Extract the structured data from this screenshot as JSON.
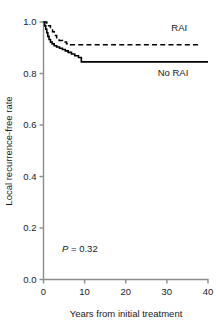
{
  "chart_data": {
    "type": "line",
    "title": "",
    "subtitle": "",
    "xlabel": "Years from initial treatment",
    "ylabel": "Local recurrence-free rate",
    "xlim": [
      0,
      40
    ],
    "ylim": [
      0.0,
      1.0
    ],
    "xticks": [
      0,
      10,
      20,
      30,
      40
    ],
    "xtick_labels": [
      "0",
      "10",
      "20",
      "30",
      "40"
    ],
    "yticks": [
      0.0,
      0.2,
      0.4,
      0.6,
      0.8,
      1.0
    ],
    "ytick_labels": [
      "0.0",
      "0.2",
      "0.4",
      "0.6",
      "0.8",
      "1.0"
    ],
    "grid": false,
    "legend_position": "inline-right",
    "annotations": [
      {
        "name": "p-value",
        "italic_prefix": "P",
        "text": " = 0.32",
        "x": 4.5,
        "y": 0.105
      }
    ],
    "series": [
      {
        "name": "RAI",
        "label": "RAI",
        "style": "dashed",
        "color": "#000000",
        "label_x": 33.0,
        "label_y": 0.965,
        "x": [
          0,
          0.4,
          0.8,
          1.2,
          1.7,
          2.2,
          2.6,
          3.2,
          3.8,
          4.6,
          5.6,
          6.6,
          38.0
        ],
        "y": [
          1.0,
          1.0,
          0.985,
          0.985,
          0.975,
          0.962,
          0.948,
          0.935,
          0.928,
          0.922,
          0.916,
          0.912,
          0.912
        ]
      },
      {
        "name": "No RAI",
        "label": "No RAI",
        "style": "solid",
        "color": "#000000",
        "label_x": 31.5,
        "label_y": 0.79,
        "x": [
          0,
          0.3,
          0.55,
          0.8,
          1.05,
          1.35,
          1.7,
          2.1,
          2.6,
          3.2,
          3.9,
          4.6,
          5.3,
          6.0,
          6.8,
          7.6,
          8.5,
          9.2,
          40.0
        ],
        "y": [
          1.0,
          0.985,
          0.972,
          0.958,
          0.944,
          0.932,
          0.922,
          0.915,
          0.908,
          0.903,
          0.898,
          0.893,
          0.888,
          0.882,
          0.876,
          0.869,
          0.862,
          0.845,
          0.845
        ]
      }
    ]
  },
  "figure": {
    "background": "#ffffff",
    "axis_color": "#8c8c8c",
    "text_color": "#1a1a1a"
  }
}
